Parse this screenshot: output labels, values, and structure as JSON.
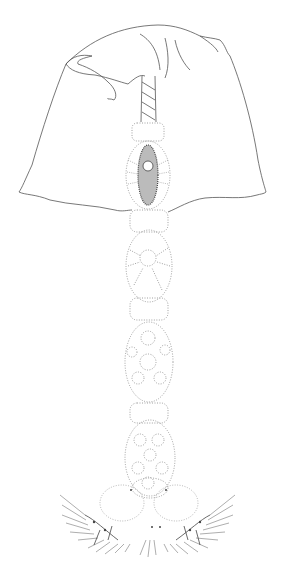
{
  "figure": {
    "background": "#ffffff",
    "line_color": "#555555",
    "dot_color": "#888888",
    "dense_color": "#444444"
  }
}
